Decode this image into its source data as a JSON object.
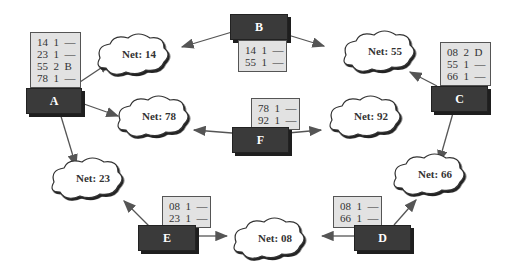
{
  "routers": [
    {
      "id": "A",
      "label": "A",
      "table": [
        "14  1  —",
        "23  1  —",
        "55  2  B",
        "78  1  —"
      ]
    },
    {
      "id": "B",
      "label": "B",
      "table": [
        "14  1  —",
        "55  1  —"
      ]
    },
    {
      "id": "C",
      "label": "C",
      "table": [
        "08  2  D",
        "55  1  —",
        "66  1  —"
      ]
    },
    {
      "id": "D",
      "label": "D",
      "table": [
        "08  1  —",
        "66  1  —"
      ]
    },
    {
      "id": "E",
      "label": "E",
      "table": [
        "08  1  —",
        "23  1  —"
      ]
    },
    {
      "id": "F",
      "label": "F",
      "table": [
        "78  1  —",
        "92  1  —"
      ]
    }
  ],
  "networks": [
    {
      "id": "14",
      "label": "Net: 14"
    },
    {
      "id": "55",
      "label": "Net: 55"
    },
    {
      "id": "78",
      "label": "Net: 78"
    },
    {
      "id": "92",
      "label": "Net: 92"
    },
    {
      "id": "23",
      "label": "Net: 23"
    },
    {
      "id": "66",
      "label": "Net: 66"
    },
    {
      "id": "08",
      "label": "Net: 08"
    }
  ]
}
